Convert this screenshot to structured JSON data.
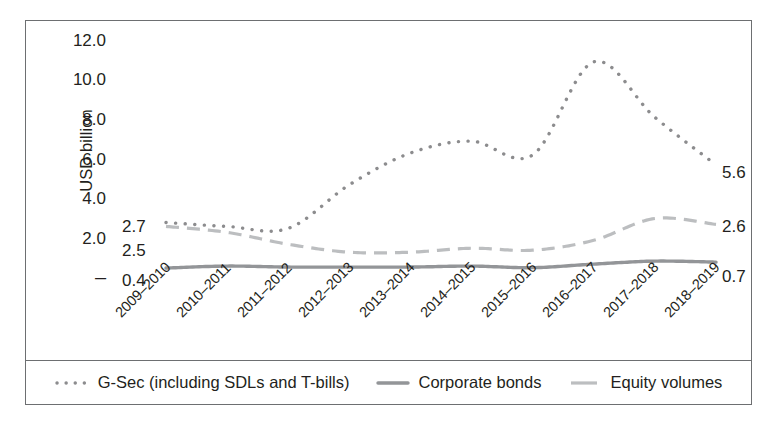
{
  "axis": {
    "y_title": "USD billion",
    "y_ticks": [
      "12.0",
      "10.0",
      "8.0",
      "6.0",
      "4.0",
      "2.0",
      "–"
    ],
    "x_ticks": [
      "2009–2010",
      "2010–2011",
      "2011–2012",
      "2012–2013",
      "2013–2014",
      "2014–2015",
      "2015–2016",
      "2016–2017",
      "2017–2018",
      "2018–2019"
    ]
  },
  "annotations": {
    "left_gsec": "2.7",
    "left_equity": "2.5",
    "left_corporate": "0.4",
    "right_gsec": "5.6",
    "right_equity": "2.6",
    "right_corporate": "0.7"
  },
  "legend": {
    "items": [
      {
        "label": "G-Sec (including SDLs and T-bills)",
        "style": "dotted",
        "color": "#8c8c8e"
      },
      {
        "label": "Corporate bonds",
        "style": "solid",
        "color": "#939598"
      },
      {
        "label": "Equity volumes",
        "style": "dashed",
        "color": "#bcbec0"
      }
    ]
  },
  "colors": {
    "gsec": "#8c8c8e",
    "corporate": "#939598",
    "equity": "#bcbec0",
    "border": "#6d6f71",
    "text": "#231f20"
  },
  "chart_data": {
    "type": "line",
    "title": "",
    "xlabel": "",
    "ylabel": "USD billion",
    "ylim": [
      0,
      12
    ],
    "yticks": [
      0,
      2,
      4,
      6,
      8,
      10,
      12
    ],
    "grid": false,
    "legend_position": "bottom",
    "categories": [
      "2009–2010",
      "2010–2011",
      "2011–2012",
      "2012–2013",
      "2013–2014",
      "2014–2015",
      "2015–2016",
      "2016–2017",
      "2017–2018",
      "2018–2019"
    ],
    "series": [
      {
        "name": "G-Sec (including SDLs and T-bills)",
        "style": "dotted",
        "values": [
          2.7,
          2.5,
          2.4,
          4.6,
          6.2,
          6.8,
          6.1,
          10.8,
          8.0,
          5.6
        ]
      },
      {
        "name": "Corporate bonds",
        "style": "solid",
        "values": [
          0.4,
          0.5,
          0.45,
          0.45,
          0.45,
          0.5,
          0.42,
          0.6,
          0.75,
          0.7
        ]
      },
      {
        "name": "Equity volumes",
        "style": "dashed",
        "values": [
          2.5,
          2.2,
          1.6,
          1.2,
          1.2,
          1.4,
          1.3,
          1.8,
          2.9,
          2.6
        ]
      }
    ],
    "annotated_endpoints": {
      "G-Sec (including SDLs and T-bills)": {
        "first": 2.7,
        "last": 5.6
      },
      "Equity volumes": {
        "first": 2.5,
        "last": 2.6
      },
      "Corporate bonds": {
        "first": 0.4,
        "last": 0.7
      }
    }
  }
}
